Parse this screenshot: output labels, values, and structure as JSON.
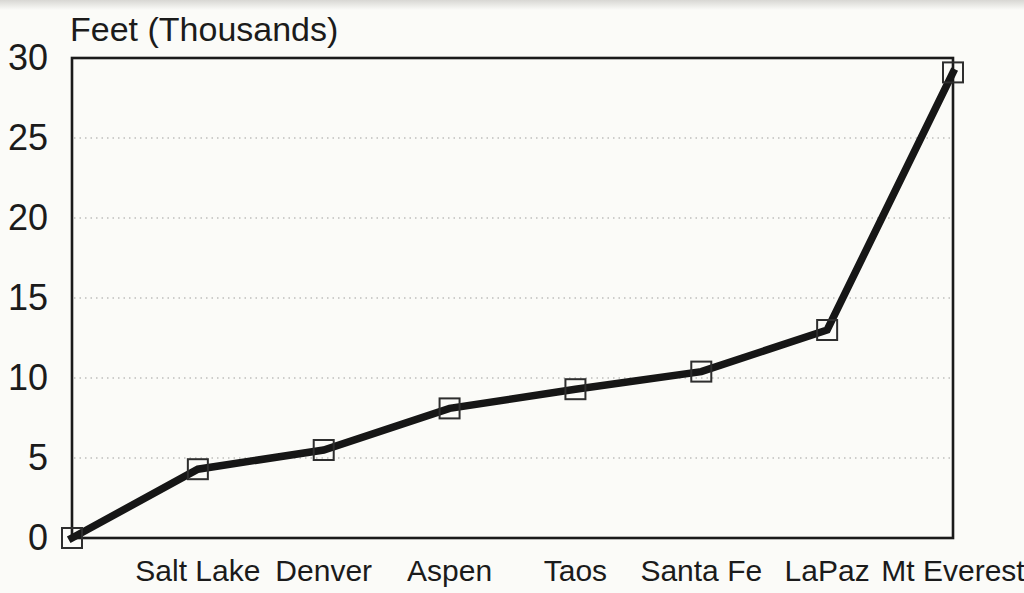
{
  "page": {
    "background_color": "#fbfbf8",
    "ink_color": "#1b1b1b"
  },
  "chart_data": {
    "type": "line",
    "title": "Feet (Thousands)",
    "xlabel": "",
    "ylabel": "Feet (Thousands)",
    "categories": [
      "",
      "Salt Lake",
      "Denver",
      "Aspen",
      "Taos",
      "Santa Fe",
      "LaPaz",
      "Mt Everest"
    ],
    "values": [
      0,
      4.3,
      5.5,
      8.1,
      9.3,
      10.4,
      13,
      29.1
    ],
    "series": [
      {
        "name": "Elevation",
        "values": [
          0,
          4.3,
          5.5,
          8.1,
          9.3,
          10.4,
          13,
          29.1
        ]
      }
    ],
    "ylim": [
      0,
      30
    ],
    "yticks": [
      0,
      5,
      10,
      15,
      20,
      25,
      30
    ],
    "gridline_values": [
      5,
      10,
      15,
      20,
      25
    ],
    "grid": "horizontal-dotted",
    "legend": "none",
    "marker": "open-square",
    "line_color": "#161616",
    "marker_border_color": "#2e2e2e",
    "grid_color": "#8f8f8f",
    "frame_color": "#1a1a1a"
  }
}
